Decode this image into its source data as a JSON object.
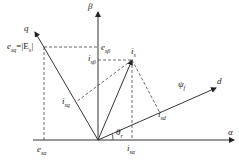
{
  "diagram": {
    "axes": {
      "alpha": "α",
      "beta": "β",
      "d": "d",
      "q": "q"
    },
    "vectors": {
      "current": "i",
      "current_sub": "s",
      "flux": "ψ",
      "flux_sub": "f"
    },
    "labels": {
      "e_sq": "e",
      "e_sq_sub": "sq",
      "E_eq": "=|E",
      "E_sub": "s",
      "E_close": "|",
      "e_sbeta": "e",
      "e_sbeta_sub": "sβ",
      "i_sbeta": "i",
      "i_sbeta_sub": "sβ",
      "i_sq": "i",
      "i_sq_sub": "sq",
      "i_sd": "i",
      "i_sd_sub": "sd",
      "e_salpha": "e",
      "e_salpha_sub": "sα",
      "i_salpha": "i",
      "i_salpha_sub": "sα",
      "theta": "θ",
      "theta_sub": "r"
    }
  }
}
